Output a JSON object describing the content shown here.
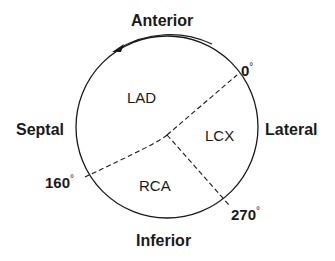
{
  "labels": {
    "anterior": "Anterior",
    "septal": "Septal",
    "lateral": "Lateral",
    "inferior": "Inferior"
  },
  "regions": {
    "lad": "LAD",
    "lcx": "LCX",
    "rca": "RCA"
  },
  "angles": {
    "a0": "0",
    "a160": "160",
    "a270": "270",
    "unit": "°"
  },
  "colors": {
    "ink": "#1a1a1a",
    "background": "#ffffff"
  }
}
